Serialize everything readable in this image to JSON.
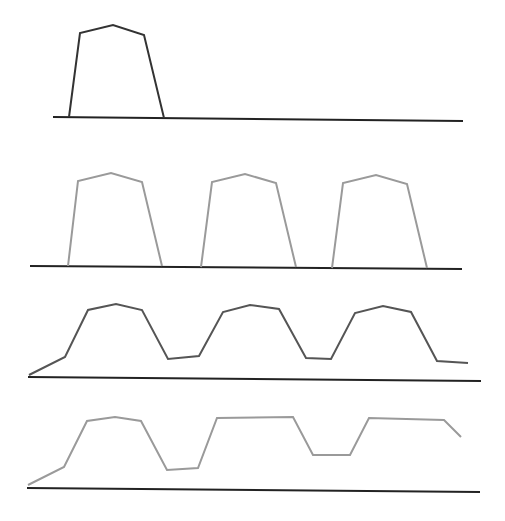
{
  "diagram": {
    "colors": {
      "baseline": "#222222",
      "panel1_line": "#333333",
      "panel2_line": "#9a9a9a",
      "panel3_line": "#555555",
      "panel4_line": "#9a9a9a"
    },
    "panels": [
      {
        "name": "single-pulse",
        "baseline": [
          [
            53,
            117
          ],
          [
            463,
            121
          ]
        ],
        "points": [
          [
            69,
            117
          ],
          [
            80,
            33
          ],
          [
            113,
            25
          ],
          [
            144,
            35
          ],
          [
            164,
            118
          ]
        ]
      },
      {
        "name": "pulse-train",
        "baseline": [
          [
            30,
            266
          ],
          [
            462,
            269
          ]
        ],
        "points_sets": [
          [
            [
              68,
              266
            ],
            [
              78,
              181
            ],
            [
              111,
              173
            ],
            [
              142,
              182
            ],
            [
              162,
              266
            ]
          ],
          [
            [
              201,
              267
            ],
            [
              212,
              182
            ],
            [
              245,
              174
            ],
            [
              276,
              183
            ],
            [
              296,
              267
            ]
          ],
          [
            [
              332,
              268
            ],
            [
              343,
              183
            ],
            [
              376,
              175
            ],
            [
              407,
              184
            ],
            [
              427,
              268
            ]
          ]
        ]
      },
      {
        "name": "smoothed-pulse-train",
        "baseline": [
          [
            28,
            377
          ],
          [
            481,
            381
          ]
        ],
        "points": [
          [
            29,
            375
          ],
          [
            65,
            357
          ],
          [
            88,
            310
          ],
          [
            116,
            304
          ],
          [
            142,
            310
          ],
          [
            168,
            359
          ],
          [
            199,
            356
          ],
          [
            223,
            312
          ],
          [
            250,
            305
          ],
          [
            279,
            309
          ],
          [
            306,
            358
          ],
          [
            331,
            359
          ],
          [
            355,
            313
          ],
          [
            383,
            306
          ],
          [
            411,
            312
          ],
          [
            437,
            361
          ],
          [
            468,
            363
          ]
        ]
      },
      {
        "name": "distorted-pulse-train",
        "baseline": [
          [
            27,
            488
          ],
          [
            480,
            492
          ]
        ],
        "points": [
          [
            28,
            485
          ],
          [
            64,
            467
          ],
          [
            87,
            421
          ],
          [
            115,
            417
          ],
          [
            141,
            421
          ],
          [
            167,
            470
          ],
          [
            198,
            468
          ],
          [
            217,
            418
          ],
          [
            293,
            417
          ],
          [
            313,
            455
          ],
          [
            350,
            455
          ],
          [
            369,
            418
          ],
          [
            444,
            420
          ],
          [
            461,
            437
          ]
        ]
      }
    ]
  }
}
